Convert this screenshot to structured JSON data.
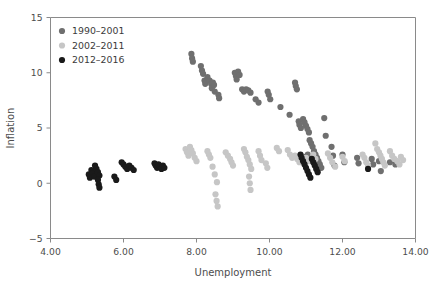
{
  "chart_data": {
    "type": "scatter",
    "title": "",
    "xlabel": "Unemployment",
    "ylabel": "Inflation",
    "xlim": [
      4.0,
      14.0
    ],
    "ylim": [
      -5,
      15
    ],
    "xticks": [
      4.0,
      6.0,
      8.0,
      10.0,
      12.0,
      14.0
    ],
    "xticklabels": [
      "4.00",
      "6.00",
      "8.00",
      "10.00",
      "12.00",
      "14.00"
    ],
    "yticks": [
      -5,
      0,
      5,
      10,
      15
    ],
    "yticklabels": [
      "−5",
      "0",
      "5",
      "10",
      "15"
    ],
    "grid": false,
    "legend_position": "upper left",
    "marker_size": 3.1,
    "series": [
      {
        "name": "1990–2001",
        "color": "#6f6f6f",
        "points": [
          [
            7.86,
            11.7
          ],
          [
            7.88,
            11.3
          ],
          [
            7.9,
            11.0
          ],
          [
            8.12,
            10.6
          ],
          [
            8.15,
            10.2
          ],
          [
            8.18,
            9.9
          ],
          [
            8.22,
            9.3
          ],
          [
            8.24,
            9.0
          ],
          [
            8.3,
            9.6
          ],
          [
            8.36,
            9.3
          ],
          [
            8.4,
            9.0
          ],
          [
            8.42,
            8.6
          ],
          [
            8.45,
            9.1
          ],
          [
            8.48,
            8.9
          ],
          [
            8.5,
            8.3
          ],
          [
            8.6,
            8.0
          ],
          [
            8.62,
            7.7
          ],
          [
            9.05,
            10.0
          ],
          [
            9.08,
            9.7
          ],
          [
            9.1,
            9.4
          ],
          [
            9.14,
            10.1
          ],
          [
            9.18,
            9.8
          ],
          [
            9.25,
            8.5
          ],
          [
            9.3,
            8.3
          ],
          [
            9.36,
            8.5
          ],
          [
            9.42,
            8.4
          ],
          [
            9.48,
            8.2
          ],
          [
            9.62,
            7.6
          ],
          [
            9.7,
            7.3
          ],
          [
            9.95,
            8.3
          ],
          [
            9.98,
            8.0
          ],
          [
            10.02,
            7.6
          ],
          [
            10.3,
            6.9
          ],
          [
            10.55,
            6.2
          ],
          [
            10.7,
            9.1
          ],
          [
            10.72,
            8.8
          ],
          [
            10.75,
            8.5
          ],
          [
            10.8,
            5.6
          ],
          [
            10.82,
            5.3
          ],
          [
            10.86,
            5.0
          ],
          [
            10.92,
            5.8
          ],
          [
            10.96,
            5.5
          ],
          [
            11.0,
            5.2
          ],
          [
            11.04,
            4.9
          ],
          [
            11.08,
            4.6
          ],
          [
            11.1,
            3.9
          ],
          [
            11.14,
            3.6
          ],
          [
            11.18,
            3.3
          ],
          [
            11.22,
            2.9
          ],
          [
            11.26,
            2.6
          ],
          [
            11.3,
            2.3
          ],
          [
            11.34,
            2.0
          ],
          [
            11.38,
            1.7
          ],
          [
            11.42,
            1.4
          ],
          [
            11.05,
            2.6
          ],
          [
            11.12,
            2.2
          ],
          [
            11.2,
            1.9
          ],
          [
            11.5,
            5.9
          ],
          [
            11.54,
            4.3
          ],
          [
            11.7,
            3.3
          ],
          [
            11.74,
            2.5
          ],
          [
            11.78,
            1.6
          ],
          [
            12.0,
            2.6
          ],
          [
            12.05,
            1.9
          ],
          [
            12.4,
            2.3
          ],
          [
            12.44,
            1.8
          ],
          [
            12.8,
            2.2
          ],
          [
            12.84,
            1.7
          ],
          [
            13.0,
            2.0
          ],
          [
            13.05,
            1.1
          ],
          [
            13.3,
            1.9
          ],
          [
            13.45,
            1.7
          ],
          [
            10.98,
            2.4
          ],
          [
            11.02,
            2.0
          ]
        ]
      },
      {
        "name": "2002–2011",
        "color": "#c6c6c6",
        "points": [
          [
            7.7,
            3.1
          ],
          [
            7.74,
            2.8
          ],
          [
            7.78,
            2.5
          ],
          [
            7.82,
            3.3
          ],
          [
            7.86,
            3.0
          ],
          [
            7.9,
            2.7
          ],
          [
            7.95,
            2.3
          ],
          [
            8.0,
            2.0
          ],
          [
            8.3,
            2.9
          ],
          [
            8.34,
            2.6
          ],
          [
            8.38,
            2.3
          ],
          [
            8.44,
            1.5
          ],
          [
            8.5,
            0.8
          ],
          [
            8.56,
            0.1
          ],
          [
            8.52,
            -1.0
          ],
          [
            8.55,
            -1.6
          ],
          [
            8.58,
            -2.1
          ],
          [
            8.8,
            2.8
          ],
          [
            8.86,
            2.5
          ],
          [
            8.92,
            2.2
          ],
          [
            8.96,
            1.9
          ],
          [
            9.0,
            1.6
          ],
          [
            9.3,
            3.1
          ],
          [
            9.34,
            2.8
          ],
          [
            9.38,
            2.4
          ],
          [
            9.42,
            2.1
          ],
          [
            9.46,
            1.7
          ],
          [
            9.5,
            1.3
          ],
          [
            9.44,
            0.6
          ],
          [
            9.46,
            0.0
          ],
          [
            9.48,
            -0.6
          ],
          [
            9.7,
            2.9
          ],
          [
            9.74,
            2.5
          ],
          [
            9.78,
            2.1
          ],
          [
            9.9,
            1.8
          ],
          [
            9.94,
            1.4
          ],
          [
            10.2,
            3.2
          ],
          [
            10.26,
            2.9
          ],
          [
            10.5,
            3.0
          ],
          [
            10.56,
            2.6
          ],
          [
            10.62,
            2.3
          ],
          [
            10.7,
            2.5
          ],
          [
            10.76,
            2.2
          ],
          [
            10.82,
            1.9
          ],
          [
            10.86,
            2.4
          ],
          [
            10.9,
            2.1
          ],
          [
            11.0,
            2.3
          ],
          [
            11.06,
            2.0
          ],
          [
            11.2,
            2.6
          ],
          [
            11.26,
            2.2
          ],
          [
            11.6,
            2.7
          ],
          [
            11.66,
            2.3
          ],
          [
            11.72,
            1.9
          ],
          [
            11.8,
            1.5
          ],
          [
            12.0,
            2.4
          ],
          [
            12.06,
            2.0
          ],
          [
            12.55,
            2.6
          ],
          [
            12.6,
            2.3
          ],
          [
            12.65,
            1.9
          ],
          [
            12.7,
            1.6
          ],
          [
            12.9,
            3.6
          ],
          [
            12.95,
            3.1
          ],
          [
            13.0,
            2.8
          ],
          [
            13.04,
            2.5
          ],
          [
            13.08,
            2.2
          ],
          [
            13.12,
            1.9
          ],
          [
            13.16,
            1.6
          ],
          [
            13.3,
            2.9
          ],
          [
            13.36,
            2.5
          ],
          [
            13.42,
            2.2
          ],
          [
            13.5,
            2.0
          ],
          [
            13.56,
            1.7
          ],
          [
            13.6,
            2.4
          ],
          [
            13.66,
            2.1
          ]
        ]
      },
      {
        "name": "2012–2016",
        "color": "#1a1a1a",
        "points": [
          [
            5.05,
            0.8
          ],
          [
            5.08,
            0.5
          ],
          [
            5.12,
            1.2
          ],
          [
            5.16,
            0.9
          ],
          [
            5.2,
            0.6
          ],
          [
            5.22,
            1.6
          ],
          [
            5.26,
            1.3
          ],
          [
            5.3,
            1.0
          ],
          [
            5.34,
            0.7
          ],
          [
            5.3,
            0.3
          ],
          [
            5.32,
            -0.1
          ],
          [
            5.34,
            -0.4
          ],
          [
            5.75,
            0.6
          ],
          [
            5.8,
            0.3
          ],
          [
            5.95,
            1.9
          ],
          [
            6.0,
            1.7
          ],
          [
            6.05,
            1.5
          ],
          [
            6.1,
            1.3
          ],
          [
            6.16,
            1.6
          ],
          [
            6.22,
            1.4
          ],
          [
            6.28,
            1.2
          ],
          [
            6.85,
            1.8
          ],
          [
            6.88,
            1.6
          ],
          [
            6.92,
            1.4
          ],
          [
            6.96,
            1.7
          ],
          [
            7.0,
            1.5
          ],
          [
            7.04,
            1.3
          ],
          [
            7.08,
            1.6
          ],
          [
            7.12,
            1.4
          ],
          [
            10.85,
            2.6
          ],
          [
            10.88,
            2.3
          ],
          [
            10.92,
            2.0
          ],
          [
            10.96,
            1.7
          ],
          [
            11.0,
            1.4
          ],
          [
            11.04,
            1.1
          ],
          [
            11.08,
            0.8
          ],
          [
            11.12,
            0.5
          ],
          [
            11.16,
            2.2
          ],
          [
            11.2,
            1.9
          ],
          [
            11.24,
            1.6
          ],
          [
            11.28,
            1.3
          ],
          [
            11.32,
            1.0
          ],
          [
            12.7,
            1.3
          ]
        ]
      }
    ]
  },
  "legend": {
    "entries": [
      {
        "label": "1990–2001",
        "color": "#6f6f6f"
      },
      {
        "label": "2002–2011",
        "color": "#c6c6c6"
      },
      {
        "label": "2012–2016",
        "color": "#1a1a1a"
      }
    ]
  },
  "axes": {
    "x_title": "Unemployment",
    "y_title": "Inflation"
  }
}
